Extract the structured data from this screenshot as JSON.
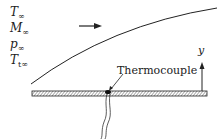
{
  "diagram": {
    "freestream_labels": [
      {
        "sym": "T",
        "sub": "∞"
      },
      {
        "sym": "M",
        "sub": "∞"
      },
      {
        "sym": "p",
        "sub": "∞"
      },
      {
        "sym": "T",
        "sub": "t∞"
      }
    ],
    "thermocouple_label": "Thermocouple",
    "axis_label": "y",
    "colors": {
      "line": "#222222",
      "background": "#ffffff"
    }
  }
}
